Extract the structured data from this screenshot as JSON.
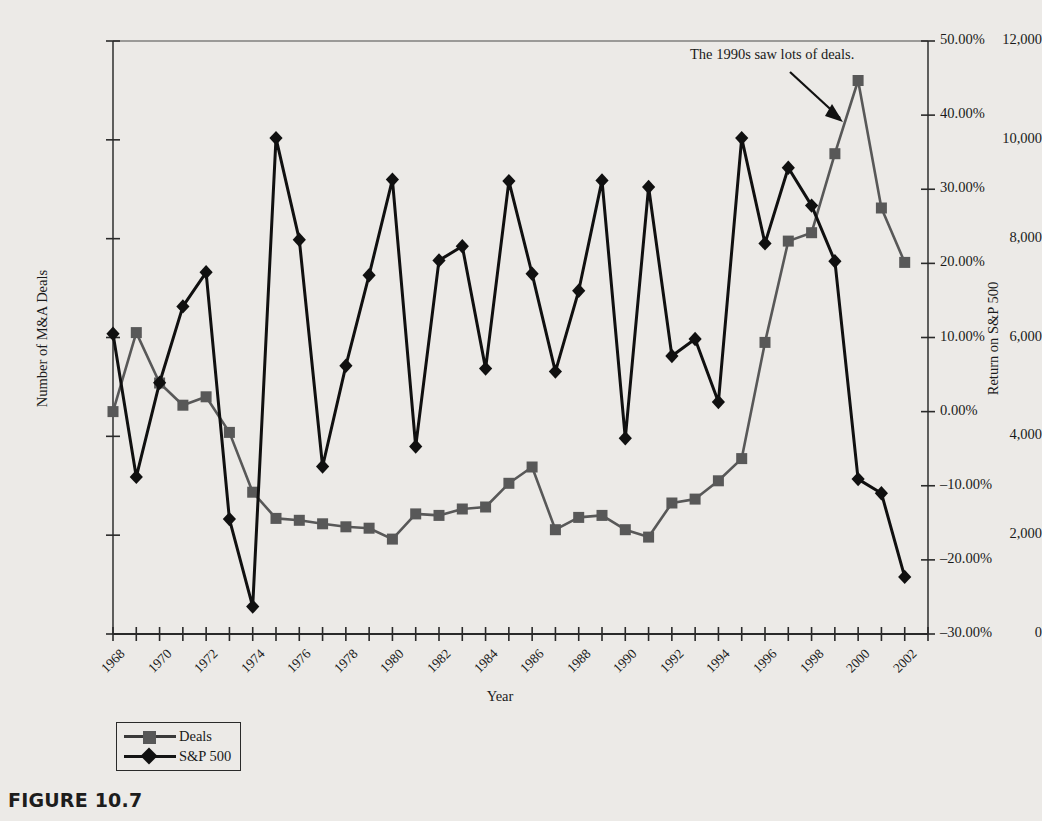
{
  "figure": {
    "caption": "FIGURE 10.7"
  },
  "chart_data": {
    "type": "line",
    "title": "",
    "xlabel": "Year",
    "grid": false,
    "legend_position": "below-left",
    "annotations": [
      {
        "text": "The 1990s saw lots of deals.",
        "points_to_year": 1999,
        "points_to_series": "Deals"
      }
    ],
    "x": [
      1968,
      1969,
      1970,
      1971,
      1972,
      1973,
      1974,
      1975,
      1976,
      1977,
      1978,
      1979,
      1980,
      1981,
      1982,
      1983,
      1984,
      1985,
      1986,
      1987,
      1988,
      1989,
      1990,
      1991,
      1992,
      1993,
      1994,
      1995,
      1996,
      1997,
      1998,
      1999,
      2000,
      2001,
      2002,
      2003
    ],
    "xtick_labels": [
      "1968",
      "1970",
      "1972",
      "1974",
      "1976",
      "1978",
      "1980",
      "1982",
      "1984",
      "1986",
      "1988",
      "1990",
      "1992",
      "1994",
      "1996",
      "1998",
      "2000",
      "2002"
    ],
    "axes": {
      "left": {
        "label": "Number of M&A Deals",
        "ylim": [
          0,
          12000
        ],
        "ticks": [
          0,
          2000,
          4000,
          6000,
          8000,
          10000,
          12000
        ],
        "tick_labels": [
          "0",
          "2,000",
          "4,000",
          "6,000",
          "8,000",
          "10,000",
          "12,000"
        ]
      },
      "right": {
        "label": "Return on S&P 500",
        "ylim": [
          -30,
          50
        ],
        "ticks": [
          -30,
          -20,
          -10,
          0,
          10,
          20,
          30,
          40,
          50
        ],
        "tick_labels": [
          "–30.00%",
          "–20.00%",
          "–10.00%",
          "0.00%",
          "10.00%",
          "20.00%",
          "30.00%",
          "40.00%",
          "50.00%"
        ]
      }
    },
    "series": [
      {
        "name": "Deals",
        "axis": "left",
        "marker": "square",
        "color": "#585858",
        "values": [
          4500,
          6100,
          5080,
          4630,
          4800,
          4080,
          2870,
          2340,
          2300,
          2230,
          2170,
          2140,
          1920,
          2430,
          2400,
          2530,
          2570,
          3050,
          3380,
          2110,
          2360,
          2400,
          2110,
          1960,
          2650,
          2730,
          3100,
          3550,
          5900,
          7950,
          8120,
          9720,
          11200,
          8620,
          7520,
          null
        ]
      },
      {
        "name": "S&P 500",
        "axis": "right",
        "marker": "diamond",
        "color": "#101010",
        "values": [
          10.5,
          -8.8,
          3.9,
          14.2,
          18.8,
          -14.5,
          -26.3,
          36.9,
          23.2,
          -7.4,
          6.2,
          18.4,
          31.3,
          -4.7,
          20.4,
          22.3,
          5.8,
          31.1,
          18.6,
          5.4,
          16.3,
          31.2,
          -3.6,
          30.3,
          7.5,
          9.8,
          1.3,
          36.9,
          22.7,
          32.9,
          27.8,
          20.3,
          -9.1,
          -11.0,
          -22.3,
          null
        ]
      }
    ]
  },
  "legend": {
    "items": [
      {
        "label": "Deals",
        "marker": "square"
      },
      {
        "label": "S&P 500",
        "marker": "diamond"
      }
    ]
  }
}
